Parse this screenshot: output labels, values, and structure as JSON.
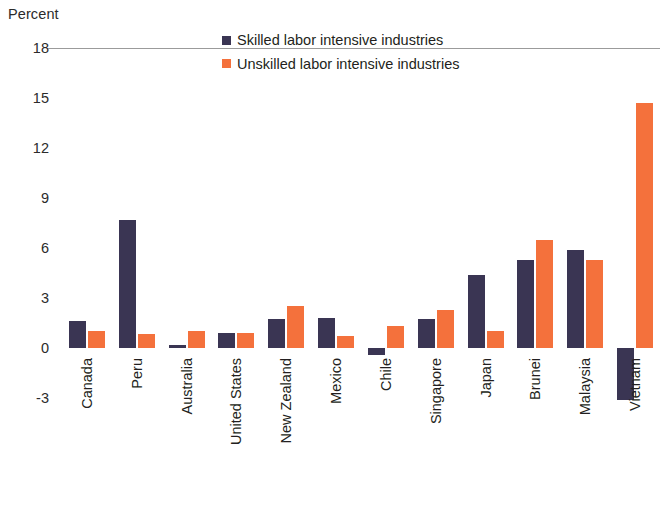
{
  "axis_title": "Percent",
  "legend": {
    "items": [
      {
        "label": "Skilled labor intensive industries",
        "color": "#3a3553"
      },
      {
        "label": "Unskilled labor intensive industries",
        "color": "#f4713c"
      }
    ]
  },
  "colors": {
    "skilled": "#3a3553",
    "unskilled": "#f4713c",
    "axis_line": "#9b9b9b",
    "text": "#231f20",
    "background": "#ffffff"
  },
  "chart_data": {
    "type": "bar",
    "title": "",
    "subtitle": "",
    "xlabel": "",
    "ylabel": "Percent",
    "ylim": [
      -3,
      18
    ],
    "yticks": [
      18,
      15,
      12,
      9,
      6,
      3,
      0,
      -3
    ],
    "ytick_labels": [
      "18",
      "15",
      "12",
      "9",
      "6",
      "3",
      "0",
      "-3"
    ],
    "grid": false,
    "legend_position": "top-center",
    "categories": [
      "Canada",
      "Peru",
      "Australia",
      "United States",
      "New Zealand",
      "Mexico",
      "Chile",
      "Singapore",
      "Japan",
      "Brunei",
      "Malaysia",
      "Vietnam"
    ],
    "series": [
      {
        "name": "Skilled labor intensive industries",
        "color": "#3a3553",
        "values": [
          1.65,
          7.7,
          0.2,
          0.9,
          1.75,
          1.8,
          -0.4,
          1.75,
          4.4,
          5.3,
          5.9,
          -3.1
        ]
      },
      {
        "name": "Unskilled labor intensive industries",
        "color": "#f4713c",
        "values": [
          1.05,
          0.85,
          1.0,
          0.9,
          2.5,
          0.75,
          1.3,
          2.3,
          1.0,
          6.5,
          5.3,
          14.7
        ]
      }
    ]
  }
}
